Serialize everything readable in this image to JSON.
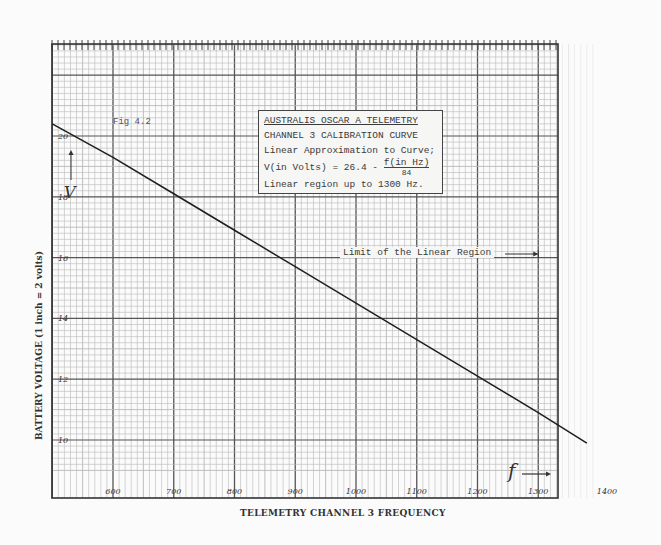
{
  "chart_data": {
    "type": "line",
    "figure_label": "Fig 4.2",
    "xlabel": "TELEMETRY CHANNEL 3 FREQUENCY",
    "ylabel": "BATTERY VOLTAGE (1 inch = 2 volts)",
    "x_ticks": [
      600,
      700,
      800,
      900,
      1000,
      1100,
      1200,
      1300,
      1400
    ],
    "y_ticks": [
      10,
      12,
      14,
      16,
      18,
      20
    ],
    "xlim": [
      500,
      1400
    ],
    "ylim": [
      9,
      21
    ],
    "grid": true,
    "series": [
      {
        "name": "Calibration curve",
        "x": [
          500,
          600,
          700,
          800,
          900,
          1000,
          1100,
          1200,
          1300,
          1380
        ],
        "y": [
          20.4,
          19.3,
          18.1,
          16.9,
          15.7,
          14.5,
          13.3,
          12.1,
          10.9,
          9.9
        ]
      }
    ],
    "annotations": [
      "Linear Approximation to Curve; V(in Volts) = 26.4 - f(in Hz)/84",
      "Linear region up to 1300 Hz.",
      "Limit of the Linear Region (arrow at 1300 Hz)",
      "f → (arrow indicating frequency axis)",
      "V (arrow indicating voltage axis)"
    ]
  },
  "info_box": {
    "line1": "AUSTRALIS OSCAR A TELEMETRY",
    "line2": "CHANNEL 3 CALIBRATION CURVE",
    "line3": "Linear Approximation to Curve;",
    "line4_prefix": "V(in Volts) = 26.4 - ",
    "line4_num": "f(in Hz)",
    "line4_den": "84",
    "line5": "Linear region up to 1300 Hz."
  },
  "labels": {
    "fig": "Fig 4.2",
    "limit": "Limit of the Linear Region",
    "x_title": "TELEMETRY CHANNEL 3 FREQUENCY",
    "y_title": "BATTERY VOLTAGE (1 inch = 2 volts)",
    "v_symbol": "V",
    "f_symbol": "f",
    "x_tick_labels": [
      "600",
      "700",
      "800",
      "900",
      "1000",
      "1100",
      "1200",
      "1300",
      "1400"
    ],
    "y_tick_labels": [
      "20",
      "18",
      "16",
      "14",
      "12",
      "10"
    ]
  },
  "colors": {
    "grid_minor": "#b8b8b8",
    "grid_major": "#555555",
    "curve": "#1e1e1e",
    "paper": "#fbfbfb"
  }
}
